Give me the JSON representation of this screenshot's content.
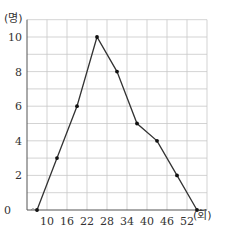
{
  "chart_data": {
    "type": "line",
    "title": "",
    "xlabel": "(회)",
    "ylabel": "(명)",
    "x_ticks": [
      10,
      16,
      22,
      28,
      34,
      40,
      46,
      52
    ],
    "y_ticks": [
      0,
      2,
      4,
      6,
      8,
      10
    ],
    "xlim": [
      4,
      58
    ],
    "ylim": [
      0,
      11
    ],
    "grid": true,
    "axis_break": true,
    "series": [
      {
        "name": "frequency polygon",
        "x": [
          7,
          13,
          19,
          25,
          31,
          37,
          43,
          49,
          55
        ],
        "y": [
          0,
          3,
          6,
          10,
          8,
          5,
          4,
          2,
          0
        ]
      }
    ]
  },
  "labels": {
    "y_unit": "(명)",
    "x_unit": "(회)",
    "origin": "0"
  },
  "colors": {
    "grid": "#c8c8c8",
    "line": "#333333",
    "axis": "#555555"
  }
}
